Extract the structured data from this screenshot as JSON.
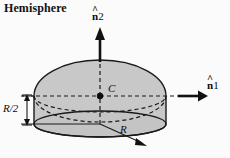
{
  "title": "Hemisphere",
  "figure": {
    "name": "hemisphere-diagram",
    "labels": {
      "axis_vertical_base": "n",
      "axis_vertical_sub": "2",
      "axis_vertical_full": "n̂2",
      "axis_horizontal_base": "n",
      "axis_horizontal_sub": "1",
      "axis_horizontal_full": "n̂1",
      "centroid": "C",
      "height_dimension": "R/2",
      "radius": "R"
    },
    "colors": {
      "background": "#fbfbfb",
      "dome_fill": "#c8c8c8",
      "base_fill": "#c2c2c2",
      "outline": "#1a1a1a",
      "dashed": "#1a1a1a",
      "text": "#0d0d0d"
    },
    "geometry": {
      "center_x": 100,
      "equator_y": 96,
      "base_y": 124,
      "dome_radius_x": 66,
      "dome_radius_y": 36,
      "base_ellipse_ry": 13
    }
  }
}
